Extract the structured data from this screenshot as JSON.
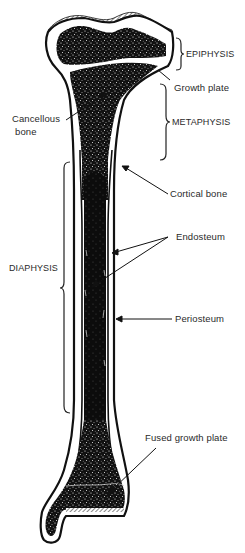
{
  "figure": {
    "colors": {
      "background": "#ffffff",
      "ink": "#111111",
      "label_text": "#2a2a2a",
      "speckle": "#ffffff"
    }
  },
  "labels": {
    "epiphysis": "EPIPHYSIS",
    "growth_plate": "Growth plate",
    "metaphysis": "METAPHYSIS",
    "cancellous_line1": "Cancellous",
    "cancellous_line2": "bone",
    "cortical_bone": "Cortical bone",
    "endosteum": "Endosteum",
    "diaphysis": "DIAPHYSIS",
    "periosteum": "Periosteum",
    "fused_growth_plate": "Fused growth plate"
  },
  "regions": [
    {
      "name": "EPIPHYSIS",
      "bracket_side": "right",
      "y_range": [
        38,
        70
      ]
    },
    {
      "name": "METAPHYSIS",
      "bracket_side": "right",
      "y_range": [
        84,
        160
      ]
    },
    {
      "name": "DIAPHYSIS",
      "bracket_side": "left",
      "y_range": [
        162,
        413
      ]
    }
  ],
  "pointers": [
    {
      "label": "Growth plate",
      "target": "epiphyseal line"
    },
    {
      "label": "Cancellous bone",
      "target": "spongy bone in metaphysis"
    },
    {
      "label": "Cortical bone",
      "target": "outer compact shaft wall"
    },
    {
      "label": "Endosteum",
      "target": "inner medullary lining (2 arrows)"
    },
    {
      "label": "Periosteum",
      "target": "outer shaft surface"
    },
    {
      "label": "Fused growth plate",
      "target": "distal epiphyseal line"
    }
  ]
}
